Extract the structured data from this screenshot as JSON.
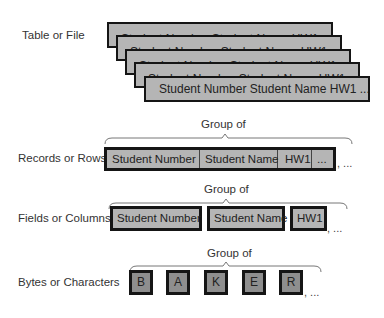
{
  "levels": [
    {
      "label": "Table or File"
    },
    {
      "label": "Records or Rows"
    },
    {
      "label": "Fields or Columns"
    },
    {
      "label": "Bytes or Characters"
    }
  ],
  "table_stack": {
    "back_text": "Student Number  Student Name  HW1",
    "front_text": "Student Number  Student Name  HW1  ..."
  },
  "group_label": "Group of",
  "record": {
    "cells": [
      "Student Number",
      "Student Name",
      "HW1",
      "..."
    ],
    "continuation": ", ..."
  },
  "fields": {
    "items": [
      "Student Number",
      "Student Name",
      "HW1"
    ],
    "continuation": ", ..."
  },
  "characters": {
    "items": [
      "B",
      "A",
      "K",
      "E",
      "R"
    ],
    "continuation": ", ..."
  },
  "colors": {
    "box_fill": "#b5b5b5",
    "char_fill": "#8e8e8e",
    "border": "#151515"
  }
}
